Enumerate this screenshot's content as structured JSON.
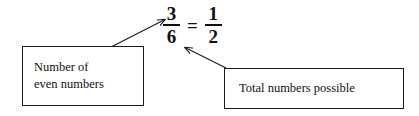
{
  "diagram": {
    "background_color": "#ffffff",
    "stroke_color": "#1a1a1a",
    "text_color": "#101010",
    "equation": {
      "left_fraction": {
        "numerator": "3",
        "denominator": "6"
      },
      "relation": "=",
      "right_fraction": {
        "numerator": "1",
        "denominator": "2"
      },
      "plain_text": "3/6 = 1/2"
    },
    "callouts": [
      {
        "id": "number-of-even-numbers",
        "line1": "Number of",
        "line2": "even numbers",
        "points_to": "numerator 3"
      },
      {
        "id": "total-numbers-possible",
        "line1": "Total numbers possible",
        "line2": "",
        "points_to": "denominator 6"
      }
    ],
    "arrows": [
      {
        "id": "arrow-to-numerator",
        "direction": "up-right",
        "from": "left callout top edge",
        "to": "numerator 3"
      },
      {
        "id": "arrow-to-denominator",
        "direction": "up-left",
        "from": "right callout top-left corner",
        "to": "denominator 6"
      }
    ]
  }
}
